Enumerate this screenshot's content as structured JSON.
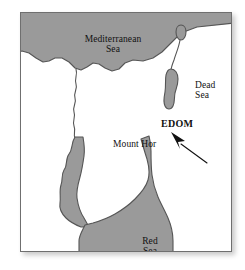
{
  "figure": {
    "type": "map",
    "frame_color": "#6f6f6f",
    "land_color": "#ffffff",
    "water_color": "#9a9a9a",
    "water_outline_color": "#555555",
    "label_color": "#111111",
    "background_color": "#ffffff"
  },
  "labels": {
    "mediterranean_sea": "Mediterranean\nSea",
    "dead_sea": "Dead\nSea",
    "edom": "EDOM",
    "mount_hor": "Mount Hor",
    "red_sea": "Red\nSea"
  },
  "features": {
    "water_bodies": [
      "Mediterranean Sea",
      "Sea of Galilee",
      "Dead Sea",
      "Red Sea",
      "Gulf of Suez",
      "Gulf of Aqaba"
    ],
    "rivers": [
      "Nile",
      "Jordan"
    ],
    "regions": [
      "EDOM"
    ],
    "points_of_interest": [
      "Mount Hor"
    ],
    "annotations": [
      "pointer-arrow"
    ]
  }
}
